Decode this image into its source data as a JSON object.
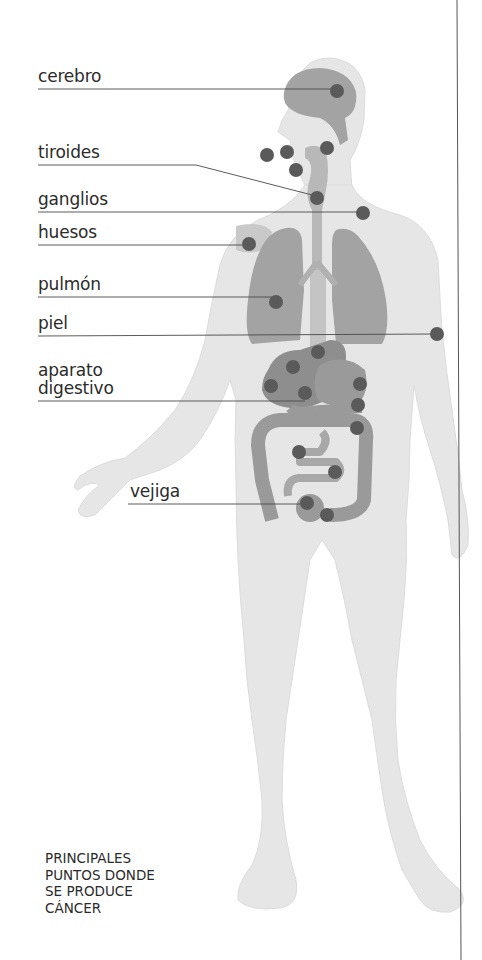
{
  "title": {
    "lines": [
      "PRINCIPALES",
      "PUNTOS DONDE",
      "SE PRODUCE",
      "CÁNCER"
    ]
  },
  "labels": {
    "cerebro": "cerebro",
    "tiroides": "tiroides",
    "ganglios": "ganglios",
    "huesos": "huesos",
    "pulmon": "pulmón",
    "piel": "piel",
    "aparato_line1": "aparato",
    "aparato_line2": "digestivo",
    "vejiga": "vejiga"
  },
  "colors": {
    "body": "#e6e6e6",
    "organ": "#a3a3a3",
    "organ_dark": "#8e8e8e",
    "dot": "#5a5a5a",
    "line": "#4a4a4a",
    "text": "#2b2b2b"
  }
}
